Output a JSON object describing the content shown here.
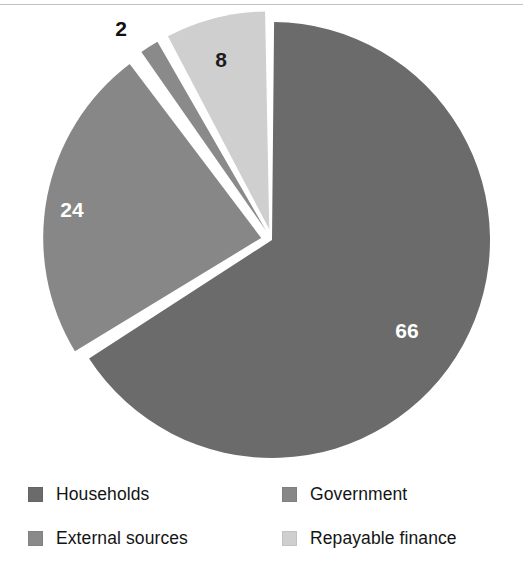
{
  "chart": {
    "type": "pie",
    "title": "",
    "center": {
      "x": 272,
      "y": 240
    },
    "radius": 218
  },
  "chart_data": {
    "type": "pie",
    "title": "",
    "subtitle": "",
    "xlabel": "",
    "ylabel": "",
    "unit": "%",
    "legend_position": "bottom",
    "grid": false,
    "categories": [
      "Households",
      "Government",
      "External sources",
      "Repayable finance"
    ],
    "values": [
      66,
      24,
      2,
      8
    ],
    "labels": [
      "66",
      "24",
      "2",
      "8"
    ],
    "colors": [
      "#6b6b6b",
      "#878787",
      "#8a8a8a",
      "#cfcfcf"
    ],
    "slices": [
      {
        "name": "Households",
        "value": 66,
        "label": "66",
        "color": "#6b6b6b",
        "start_angle": 0,
        "end_angle": 237.6,
        "exploded": false,
        "label_position": "inside",
        "label_color": "#ffffff",
        "label_x": 407,
        "label_y": 330
      },
      {
        "name": "Government",
        "value": 24,
        "label": "24",
        "color": "#878787",
        "start_angle": 237.6,
        "end_angle": 324.0,
        "exploded": true,
        "label_position": "inside",
        "label_color": "#ffffff",
        "label_x": 72,
        "label_y": 209
      },
      {
        "name": "External sources",
        "value": 2,
        "label": "2",
        "color": "#8a8a8a",
        "start_angle": 324.0,
        "end_angle": 331.2,
        "exploded": true,
        "label_position": "outside",
        "label_color": "#111111",
        "label_x": 121,
        "label_y": 28
      },
      {
        "name": "Repayable finance",
        "value": 8,
        "label": "8",
        "color": "#cfcfcf",
        "start_angle": 331.2,
        "end_angle": 360,
        "exploded": true,
        "label_position": "inside",
        "label_color": "#1c1c1c",
        "label_x": 221,
        "label_y": 59
      }
    ]
  },
  "legend": {
    "left_column": [
      {
        "label": "Households",
        "color": "#6b6b6b"
      },
      {
        "label": "External sources",
        "color": "#8a8a8a"
      }
    ],
    "right_column": [
      {
        "label": "Government",
        "color": "#878787"
      },
      {
        "label": "Repayable finance",
        "color": "#cfcfcf"
      }
    ]
  },
  "artifacts": {
    "ghost_a": "scanned page bleed-through",
    "ghost_b": "scanned page bleed-through",
    "ghost_c": "scanned page bleed-through",
    "ghost_d": "scanned page bleed-through"
  }
}
